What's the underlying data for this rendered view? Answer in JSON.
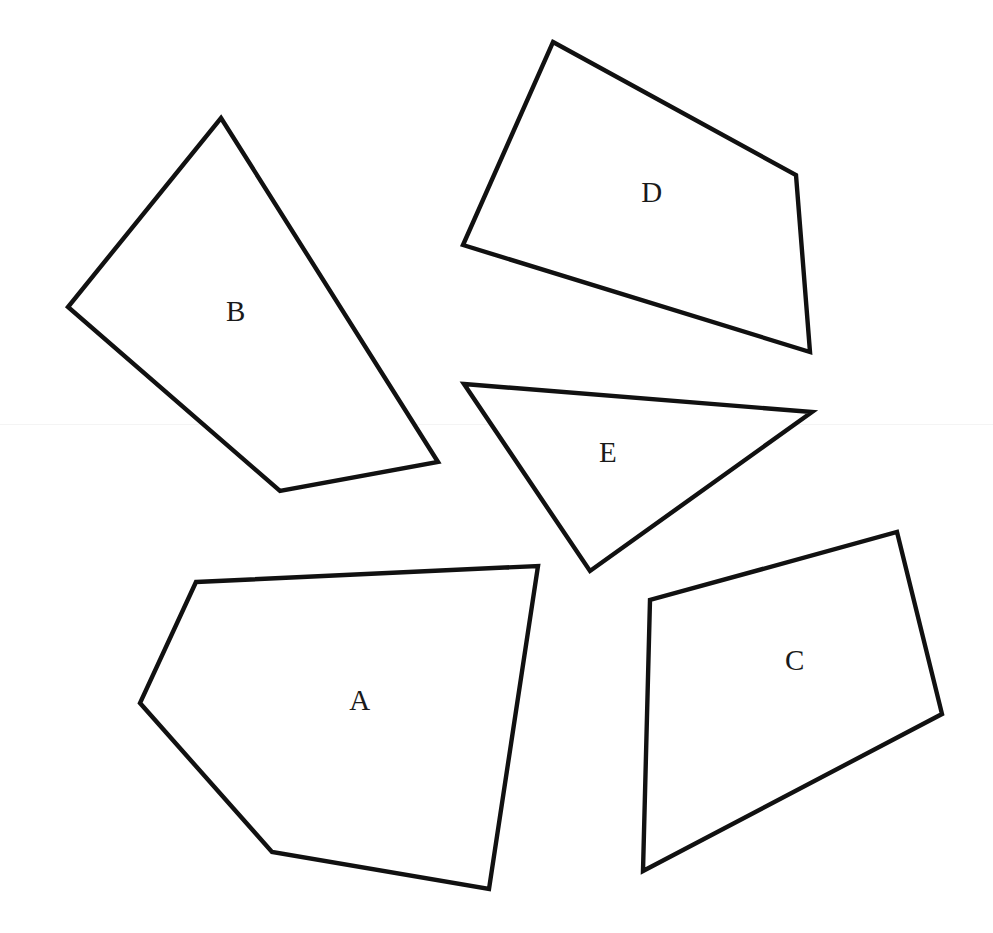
{
  "figure": {
    "width": 993,
    "height": 933,
    "background_color": "#ffffff",
    "stroke_color": "#111111",
    "label_color": "#1a1a1a",
    "stroke_width": 4.4
  },
  "artifacts": [
    {
      "name": "scan-line",
      "y": 424,
      "color": "#f4f4f4"
    }
  ],
  "shapes": [
    {
      "id": "A",
      "label": "A",
      "kind": "pentagon",
      "sides": 5,
      "points": "196,582 538,566 489,889 272,852 140,703",
      "label_x": 360,
      "label_y": 703
    },
    {
      "id": "B",
      "label": "B",
      "kind": "quadrilateral",
      "sides": 4,
      "points": "221,118 438,462 280,491 68,307",
      "label_x": 236,
      "label_y": 314
    },
    {
      "id": "C",
      "label": "C",
      "kind": "quadrilateral",
      "sides": 4,
      "points": "897,532 942,714 643,871 650,600",
      "label_x": 795,
      "label_y": 663
    },
    {
      "id": "D",
      "label": "D",
      "kind": "quadrilateral",
      "sides": 4,
      "points": "553,42 796,175 810,352 463,245",
      "label_x": 652,
      "label_y": 195
    },
    {
      "id": "E",
      "label": "E",
      "kind": "triangle",
      "sides": 3,
      "points": "464,384 812,412 590,571",
      "label_x": 608,
      "label_y": 455
    }
  ]
}
